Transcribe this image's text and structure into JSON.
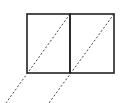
{
  "diagram": {
    "width": 124,
    "height": 103,
    "background": "#ffffff",
    "stroke_color": "#222222",
    "dash_color": "#444444",
    "squares": [
      {
        "x": 27,
        "y": 14,
        "w": 43,
        "h": 59
      },
      {
        "x": 70,
        "y": 14,
        "w": 44,
        "h": 59
      }
    ],
    "dashed_lines": [
      {
        "x1": 70,
        "y1": 14,
        "x2": 6,
        "y2": 103
      },
      {
        "x1": 114,
        "y1": 14,
        "x2": 49,
        "y2": 103
      }
    ]
  }
}
